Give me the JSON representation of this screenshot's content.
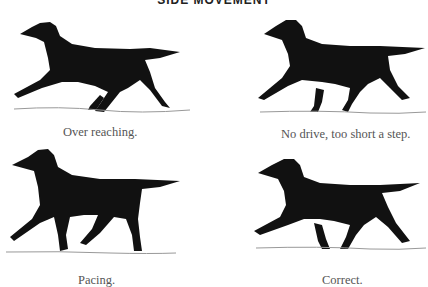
{
  "page": {
    "title": "SIDE MOVEMENT",
    "figures": [
      {
        "caption": "Over reaching.",
        "icon": "dog-trotting-illustration"
      },
      {
        "caption": "No drive, too short a step.",
        "icon": "dog-trotting-illustration"
      },
      {
        "caption": "Pacing.",
        "icon": "dog-trotting-illustration"
      },
      {
        "caption": "Correct.",
        "icon": "dog-trotting-illustration"
      }
    ],
    "colors": {
      "ink": "#111111",
      "caption": "#555555",
      "ground": "#999999"
    }
  }
}
